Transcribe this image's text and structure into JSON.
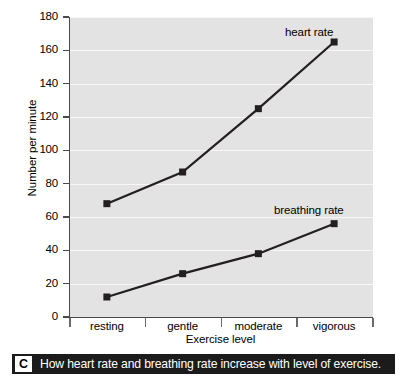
{
  "chart_data": {
    "type": "line",
    "title": "",
    "categories": [
      "resting",
      "gentle",
      "moderate",
      "vigorous"
    ],
    "xlabel": "Exercise level",
    "ylabel": "Number per minute",
    "ylim": [
      0,
      180
    ],
    "ytick_step": 20,
    "yticks": [
      180,
      160,
      140,
      120,
      100,
      80,
      60,
      40,
      20,
      0
    ],
    "grid": true,
    "legend_position": "inline-right-of-last-point",
    "series": [
      {
        "name": "heart rate",
        "values": [
          68,
          87,
          125,
          165
        ],
        "color": "#231f20",
        "marker": "square"
      },
      {
        "name": "breathing rate",
        "values": [
          12,
          26,
          38,
          56
        ],
        "color": "#231f20",
        "marker": "square"
      }
    ]
  },
  "caption": {
    "letter": "C",
    "text": "How heart rate and breathing rate increase with level of exercise."
  },
  "colors": {
    "plot_background": "#e3e3e3",
    "gridline": "#f7f7f7",
    "axis": "#4a4a4a",
    "line": "#231f20",
    "caption_background": "#1b1b1b",
    "caption_text": "#ffffff"
  }
}
